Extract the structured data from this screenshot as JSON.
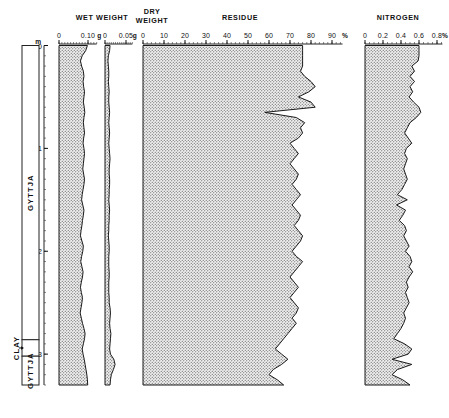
{
  "figure": {
    "kind": "stratigraphic-pollen-style-core-diagram",
    "background": "#ffffff",
    "line_color": "#1a1a1a",
    "fill_pattern": "stipple-dots",
    "fill_color": "#e9e9e9"
  },
  "depth_axis": {
    "label": "",
    "unit": "m",
    "ticks": [
      "0",
      "1",
      "2",
      "3"
    ],
    "values": [
      0,
      1,
      2,
      3
    ],
    "range": [
      0,
      3.3
    ],
    "minor_step": 0.1
  },
  "lithology": {
    "name": "lithology-column",
    "units": [
      {
        "label": "GYTTJA",
        "top": 0.0,
        "bottom": 2.86
      },
      {
        "label": "CLAY",
        "top": 2.86,
        "bottom": 3.02
      },
      {
        "label": "GYTTJA",
        "top": 3.02,
        "bottom": 3.3
      }
    ]
  },
  "chart_data": [
    {
      "type": "area",
      "name": "wet-weight",
      "title": "WET WEIGHT",
      "xlabel": "g",
      "ylabel": "Depth (m)",
      "unit_symbol": "g",
      "xlim": [
        0,
        0.13
      ],
      "xticks": [
        0,
        0.1
      ],
      "xticklabels": [
        "0",
        "0.10"
      ],
      "minor_tick_step": 0.01,
      "grid": false,
      "orientation": "vertical-depth",
      "depth": [
        0.0,
        0.05,
        0.1,
        0.15,
        0.2,
        0.25,
        0.3,
        0.35,
        0.4,
        0.45,
        0.5,
        0.55,
        0.6,
        0.65,
        0.7,
        0.75,
        0.8,
        0.85,
        0.9,
        0.95,
        1.0,
        1.05,
        1.1,
        1.15,
        1.2,
        1.25,
        1.3,
        1.35,
        1.4,
        1.45,
        1.5,
        1.55,
        1.6,
        1.65,
        1.7,
        1.75,
        1.8,
        1.85,
        1.9,
        1.95,
        2.0,
        2.05,
        2.1,
        2.15,
        2.2,
        2.25,
        2.3,
        2.35,
        2.4,
        2.45,
        2.5,
        2.55,
        2.6,
        2.65,
        2.7,
        2.75,
        2.8,
        2.85,
        2.9,
        2.95,
        3.0,
        3.05,
        3.1,
        3.15,
        3.2,
        3.25,
        3.3
      ],
      "values": [
        0.098,
        0.092,
        0.08,
        0.074,
        0.078,
        0.084,
        0.086,
        0.083,
        0.085,
        0.088,
        0.086,
        0.084,
        0.087,
        0.089,
        0.086,
        0.084,
        0.086,
        0.088,
        0.085,
        0.083,
        0.086,
        0.088,
        0.086,
        0.084,
        0.082,
        0.085,
        0.088,
        0.086,
        0.083,
        0.08,
        0.078,
        0.082,
        0.086,
        0.084,
        0.081,
        0.079,
        0.076,
        0.074,
        0.079,
        0.084,
        0.082,
        0.078,
        0.075,
        0.079,
        0.083,
        0.081,
        0.077,
        0.074,
        0.077,
        0.081,
        0.079,
        0.076,
        0.073,
        0.077,
        0.081,
        0.086,
        0.09,
        0.088,
        0.084,
        0.08,
        0.083,
        0.087,
        0.09,
        0.093,
        0.096,
        0.098,
        0.099
      ]
    },
    {
      "type": "area",
      "name": "dry-weight",
      "title": "DRY WEIGHT",
      "title_line1": "DRY",
      "title_line2": "WEIGHT",
      "xlabel": "g",
      "unit_symbol": "g",
      "xlim": [
        0,
        0.065
      ],
      "xticks": [
        0,
        0.05
      ],
      "xticklabels": [
        "0",
        "0.05"
      ],
      "minor_tick_step": 0.005,
      "grid": false,
      "orientation": "vertical-depth",
      "depth": [
        0.0,
        0.05,
        0.1,
        0.15,
        0.2,
        0.25,
        0.3,
        0.35,
        0.4,
        0.45,
        0.5,
        0.55,
        0.6,
        0.65,
        0.7,
        0.75,
        0.8,
        0.85,
        0.9,
        0.95,
        1.0,
        1.05,
        1.1,
        1.15,
        1.2,
        1.25,
        1.3,
        1.35,
        1.4,
        1.45,
        1.5,
        1.55,
        1.6,
        1.65,
        1.7,
        1.75,
        1.8,
        1.85,
        1.9,
        1.95,
        2.0,
        2.05,
        2.1,
        2.15,
        2.2,
        2.25,
        2.3,
        2.35,
        2.4,
        2.45,
        2.5,
        2.55,
        2.6,
        2.65,
        2.7,
        2.75,
        2.8,
        2.85,
        2.9,
        2.95,
        3.0,
        3.05,
        3.1,
        3.15,
        3.2,
        3.25,
        3.3
      ],
      "values": [
        0.012,
        0.011,
        0.008,
        0.007,
        0.008,
        0.009,
        0.009,
        0.008,
        0.009,
        0.01,
        0.009,
        0.009,
        0.01,
        0.011,
        0.01,
        0.009,
        0.01,
        0.011,
        0.01,
        0.009,
        0.01,
        0.011,
        0.012,
        0.011,
        0.01,
        0.01,
        0.011,
        0.011,
        0.01,
        0.01,
        0.009,
        0.01,
        0.011,
        0.01,
        0.01,
        0.009,
        0.009,
        0.008,
        0.009,
        0.01,
        0.01,
        0.009,
        0.009,
        0.009,
        0.01,
        0.01,
        0.009,
        0.009,
        0.009,
        0.01,
        0.01,
        0.012,
        0.013,
        0.012,
        0.011,
        0.012,
        0.014,
        0.013,
        0.012,
        0.011,
        0.013,
        0.021,
        0.024,
        0.02,
        0.015,
        0.013,
        0.012
      ]
    },
    {
      "type": "area",
      "name": "residue",
      "title": "RESIDUE",
      "xlabel": "%",
      "unit_symbol": "%",
      "xlim": [
        0,
        95
      ],
      "xticks": [
        0,
        10,
        20,
        30,
        40,
        50,
        60,
        70,
        80,
        90
      ],
      "xticklabels": [
        "0",
        "10",
        "20",
        "30",
        "40",
        "50",
        "60",
        "70",
        "80",
        "90"
      ],
      "minor_tick_step": 2,
      "grid": false,
      "orientation": "vertical-depth",
      "depth": [
        0.0,
        0.05,
        0.1,
        0.15,
        0.2,
        0.25,
        0.3,
        0.35,
        0.4,
        0.45,
        0.5,
        0.55,
        0.6,
        0.65,
        0.7,
        0.75,
        0.8,
        0.85,
        0.9,
        0.95,
        1.0,
        1.05,
        1.1,
        1.15,
        1.2,
        1.25,
        1.3,
        1.35,
        1.4,
        1.45,
        1.5,
        1.55,
        1.6,
        1.65,
        1.7,
        1.75,
        1.8,
        1.85,
        1.9,
        1.95,
        2.0,
        2.05,
        2.1,
        2.15,
        2.2,
        2.25,
        2.3,
        2.35,
        2.4,
        2.45,
        2.5,
        2.55,
        2.6,
        2.65,
        2.7,
        2.75,
        2.8,
        2.85,
        2.9,
        2.95,
        3.0,
        3.05,
        3.1,
        3.15,
        3.2,
        3.25,
        3.3
      ],
      "values": [
        76,
        76,
        76,
        76,
        76,
        75,
        77,
        80,
        82,
        79,
        74,
        80,
        82,
        58,
        73,
        77,
        75,
        76,
        74,
        70,
        72,
        74,
        72,
        70,
        72,
        74,
        73,
        71,
        73,
        75,
        73,
        71,
        73,
        75,
        74,
        72,
        74,
        76,
        75,
        73,
        71,
        73,
        76,
        74,
        72,
        70,
        72,
        74,
        72,
        70,
        72,
        74,
        73,
        71,
        73,
        71,
        69,
        67,
        65,
        63,
        66,
        69,
        66,
        62,
        60,
        64,
        67
      ]
    },
    {
      "type": "area",
      "name": "nitrogen",
      "title": "NITROGEN",
      "xlabel": "%",
      "unit_symbol": "%",
      "xlim": [
        0,
        0.86
      ],
      "xticks": [
        0,
        0.2,
        0.4,
        0.6,
        0.8
      ],
      "xticklabels": [
        "0",
        "0.2",
        "0.4",
        "0.6",
        "0.8"
      ],
      "minor_tick_step": 0.05,
      "grid": false,
      "orientation": "vertical-depth",
      "depth": [
        0.0,
        0.05,
        0.1,
        0.15,
        0.2,
        0.25,
        0.3,
        0.35,
        0.4,
        0.45,
        0.5,
        0.55,
        0.6,
        0.65,
        0.7,
        0.75,
        0.8,
        0.85,
        0.9,
        0.95,
        1.0,
        1.05,
        1.1,
        1.15,
        1.2,
        1.25,
        1.3,
        1.35,
        1.4,
        1.45,
        1.5,
        1.55,
        1.6,
        1.65,
        1.7,
        1.75,
        1.8,
        1.85,
        1.9,
        1.95,
        2.0,
        2.05,
        2.1,
        2.15,
        2.2,
        2.25,
        2.3,
        2.35,
        2.4,
        2.45,
        2.5,
        2.55,
        2.6,
        2.65,
        2.7,
        2.75,
        2.8,
        2.85,
        2.9,
        2.95,
        3.0,
        3.05,
        3.1,
        3.15,
        3.2,
        3.25,
        3.3
      ],
      "values": [
        0.6,
        0.6,
        0.6,
        0.59,
        0.52,
        0.55,
        0.5,
        0.55,
        0.5,
        0.53,
        0.49,
        0.54,
        0.6,
        0.62,
        0.57,
        0.5,
        0.47,
        0.44,
        0.48,
        0.52,
        0.46,
        0.44,
        0.47,
        0.45,
        0.43,
        0.45,
        0.47,
        0.44,
        0.41,
        0.36,
        0.47,
        0.35,
        0.45,
        0.42,
        0.38,
        0.44,
        0.46,
        0.43,
        0.46,
        0.49,
        0.45,
        0.5,
        0.52,
        0.49,
        0.53,
        0.49,
        0.46,
        0.48,
        0.45,
        0.47,
        0.49,
        0.46,
        0.43,
        0.45,
        0.43,
        0.4,
        0.36,
        0.32,
        0.44,
        0.52,
        0.48,
        0.3,
        0.52,
        0.36,
        0.3,
        0.42,
        0.5
      ]
    }
  ]
}
